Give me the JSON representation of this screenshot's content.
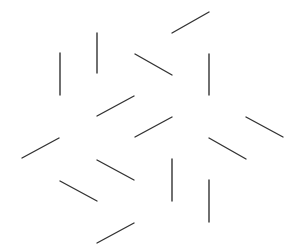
{
  "canvas": {
    "width": 299,
    "height": 252,
    "background": "#ffffff"
  },
  "style": {
    "stroke": "#333333",
    "stroke_width": 1.4
  },
  "segments": [
    {
      "id": "seg-1",
      "orientation": "vertical",
      "x1": 60,
      "y1": 53,
      "x2": 60,
      "y2": 95
    },
    {
      "id": "seg-2",
      "orientation": "vertical",
      "x1": 97,
      "y1": 33,
      "x2": 97,
      "y2": 73
    },
    {
      "id": "seg-3",
      "orientation": "rising",
      "x1": 172,
      "y1": 33,
      "x2": 209,
      "y2": 12
    },
    {
      "id": "seg-4",
      "orientation": "falling",
      "x1": 135,
      "y1": 54,
      "x2": 172,
      "y2": 75
    },
    {
      "id": "seg-5",
      "orientation": "vertical",
      "x1": 209,
      "y1": 54,
      "x2": 209,
      "y2": 95
    },
    {
      "id": "seg-6",
      "orientation": "rising",
      "x1": 97,
      "y1": 116,
      "x2": 134,
      "y2": 96
    },
    {
      "id": "seg-7",
      "orientation": "rising",
      "x1": 135,
      "y1": 137,
      "x2": 172,
      "y2": 117
    },
    {
      "id": "seg-8",
      "orientation": "falling",
      "x1": 246,
      "y1": 117,
      "x2": 283,
      "y2": 137
    },
    {
      "id": "seg-9",
      "orientation": "rising",
      "x1": 22,
      "y1": 158,
      "x2": 59,
      "y2": 138
    },
    {
      "id": "seg-10",
      "orientation": "falling",
      "x1": 209,
      "y1": 138,
      "x2": 246,
      "y2": 159
    },
    {
      "id": "seg-11",
      "orientation": "falling",
      "x1": 97,
      "y1": 160,
      "x2": 134,
      "y2": 180
    },
    {
      "id": "seg-12",
      "orientation": "vertical",
      "x1": 172,
      "y1": 159,
      "x2": 172,
      "y2": 201
    },
    {
      "id": "seg-13",
      "orientation": "falling",
      "x1": 60,
      "y1": 181,
      "x2": 97,
      "y2": 201
    },
    {
      "id": "seg-14",
      "orientation": "vertical",
      "x1": 209,
      "y1": 180,
      "x2": 209,
      "y2": 222
    },
    {
      "id": "seg-15",
      "orientation": "rising",
      "x1": 97,
      "y1": 243,
      "x2": 134,
      "y2": 223
    }
  ]
}
